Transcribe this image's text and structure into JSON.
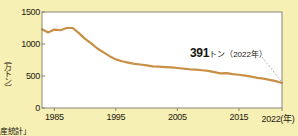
{
  "figure": {
    "background_color": "#f7f0b4",
    "plot_background_color": "#ffffff",
    "line_color": "#c98f45",
    "axis_color": "#8a8577",
    "leader_color": "#9a9a9a",
    "y_axis_unit_label": "（万トン）",
    "source_note": "産統計」",
    "annotation": {
      "value": "391",
      "unit": "トン",
      "year": "（2022年）"
    }
  },
  "chart_data": {
    "type": "line",
    "title": "",
    "subtitle": "",
    "xlabel": "（年）",
    "ylabel": "（万トン）",
    "xlim": [
      1983,
      2022
    ],
    "ylim": [
      0,
      1500
    ],
    "grid": false,
    "legend": "none",
    "y_ticks": [
      0,
      500,
      1000,
      1500
    ],
    "y_tick_labels": [
      "0",
      "500",
      "1000",
      "1500"
    ],
    "x_ticks": [
      1985,
      1995,
      2005,
      2015,
      2022
    ],
    "x_tick_labels": [
      "1985",
      "1995",
      "2005",
      "2015",
      "2022"
    ],
    "x_axis_suffix": "(年)",
    "series": [
      {
        "name": "生産量",
        "unit": "万トン",
        "x": [
          1983,
          1984,
          1985,
          1986,
          1987,
          1988,
          1989,
          1990,
          1991,
          1992,
          1993,
          1994,
          1995,
          1996,
          1997,
          1998,
          1999,
          2000,
          2001,
          2002,
          2003,
          2004,
          2005,
          2006,
          2007,
          2008,
          2009,
          2010,
          2011,
          2012,
          2013,
          2014,
          2015,
          2016,
          2017,
          2018,
          2019,
          2020,
          2021,
          2022
        ],
        "values": [
          1230,
          1180,
          1225,
          1215,
          1250,
          1250,
          1170,
          1080,
          1010,
          930,
          870,
          810,
          760,
          730,
          710,
          690,
          680,
          665,
          650,
          645,
          640,
          635,
          625,
          615,
          605,
          600,
          590,
          580,
          560,
          540,
          545,
          530,
          520,
          505,
          490,
          470,
          460,
          440,
          420,
          391
        ]
      }
    ],
    "annotations": [
      {
        "text": "391トン（2022年）",
        "x": 2022,
        "y": 391
      }
    ]
  }
}
